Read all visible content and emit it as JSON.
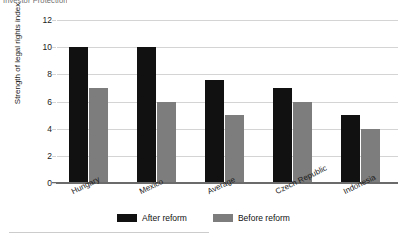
{
  "figure": {
    "title_fragment": "Investor Protection"
  },
  "axes": {
    "ylabel": "Strength of legal rights index",
    "yticks": [
      "0",
      "2",
      "4",
      "6",
      "8",
      "10",
      "12"
    ],
    "ymin": 0,
    "ymax": 12
  },
  "legend": {
    "items": [
      {
        "label": "After reform",
        "color": "#111111"
      },
      {
        "label": "Before reform",
        "color": "#7d7d7d"
      }
    ]
  },
  "chart_data": {
    "type": "bar",
    "title": "Investor Protection",
    "xlabel": "",
    "ylabel": "Strength of legal rights index",
    "ylim": [
      0,
      12
    ],
    "yticks": [
      0,
      2,
      4,
      6,
      8,
      10,
      12
    ],
    "grid": true,
    "legend_position": "bottom-center",
    "categories": [
      "Hungary",
      "Mexico",
      "Average",
      "Czech Republic",
      "Indonesia"
    ],
    "series": [
      {
        "name": "After reform",
        "color": "#111111",
        "values": [
          10,
          10,
          7.6,
          7,
          5
        ]
      },
      {
        "name": "Before reform",
        "color": "#7d7d7d",
        "values": [
          7,
          6,
          5,
          6,
          4
        ]
      }
    ]
  }
}
